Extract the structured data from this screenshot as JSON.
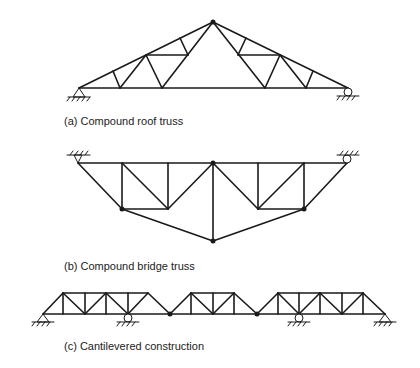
{
  "figures": [
    {
      "id": "a",
      "caption": "(a) Compound roof truss"
    },
    {
      "id": "b",
      "caption": "(b) Compound bridge truss"
    },
    {
      "id": "c",
      "caption": "(c) Cantilevered construction"
    }
  ],
  "colors": {
    "line": "#1a1a1a",
    "background": "#ffffff"
  }
}
